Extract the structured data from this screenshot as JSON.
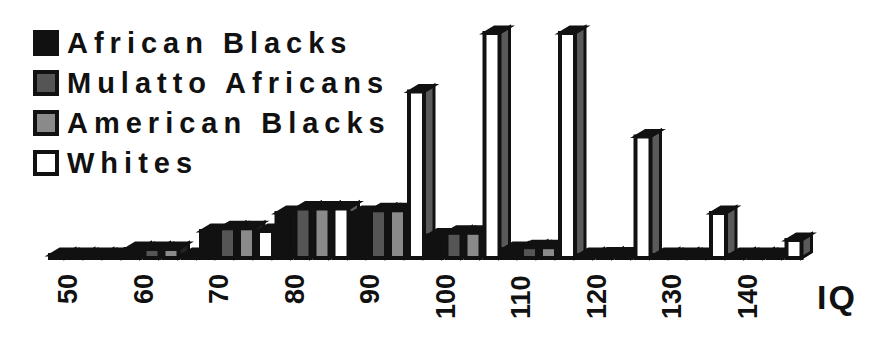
{
  "chart_data": {
    "type": "bar",
    "title": "",
    "xlabel": "IQ",
    "ylabel": "",
    "categories": [
      "50",
      "60",
      "70",
      "80",
      "90",
      "100",
      "110",
      "120",
      "130",
      "140"
    ],
    "series": [
      {
        "name": "African Blacks",
        "color": "#111111",
        "values": [
          0.3,
          1.0,
          3.0,
          5.0,
          5.0,
          2.5,
          1.0,
          0.3,
          0.0,
          0.0
        ]
      },
      {
        "name": "Mulatto Africans",
        "color": "#555555",
        "values": [
          0.2,
          1.0,
          3.3,
          5.5,
          5.3,
          2.8,
          1.2,
          0.4,
          0.0,
          0.0
        ]
      },
      {
        "name": "American Blacks",
        "color": "#8a8a8a",
        "values": [
          0.1,
          1.0,
          3.3,
          5.5,
          5.3,
          2.8,
          1.2,
          0.4,
          0.0,
          0.0
        ]
      },
      {
        "name": "Whites",
        "color": "#ffffff",
        "values": [
          0.0,
          0.1,
          3.0,
          5.5,
          18.5,
          25.0,
          25.0,
          13.5,
          5.0,
          2.0
        ]
      }
    ],
    "ylim": [
      0,
      25
    ],
    "grid": false,
    "legend_position": "top-left",
    "style": "3d-clustered"
  },
  "legend": {
    "items": [
      {
        "label": "African Blacks",
        "swatch": "#111111"
      },
      {
        "label": "Mulatto Africans",
        "swatch": "#555555"
      },
      {
        "label": "American Blacks",
        "swatch": "#8a8a8a"
      },
      {
        "label": "Whites",
        "swatch": "#ffffff"
      }
    ]
  },
  "axis": {
    "x_title": "IQ"
  }
}
